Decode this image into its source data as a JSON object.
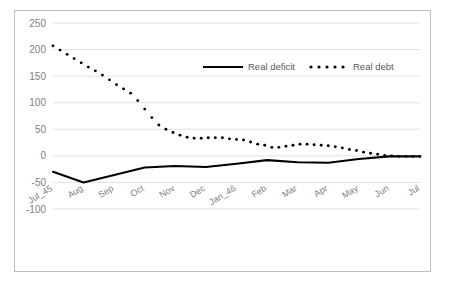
{
  "chart_data": {
    "type": "line",
    "title": "",
    "subtitle": "",
    "xlabel": "",
    "ylabel": "",
    "ylim": [
      -100,
      250
    ],
    "ytick_step": 50,
    "yticks": [
      "250",
      "200",
      "150",
      "100",
      "50",
      "0",
      "-50",
      "-100"
    ],
    "grid": true,
    "legend_position": "top-center",
    "categories": [
      "Jul_45",
      "Aug",
      "Sep",
      "Oct",
      "Nov",
      "Dec",
      "Jan_46",
      "Feb",
      "Mar",
      "Apr",
      "May",
      "Jun",
      "Jul"
    ],
    "x": [
      "Jul_45",
      "Aug",
      "Sep",
      "Oct",
      "Nov",
      "Dec",
      "Jan_46",
      "Feb",
      "Mar",
      "Apr",
      "May",
      "Jun",
      "Jul"
    ],
    "series": [
      {
        "name": "Real deficit",
        "style": "solid",
        "color": "#000000",
        "values": [
          -30,
          -50,
          -36,
          -22,
          -19,
          -21,
          -15,
          -8,
          -12,
          -13,
          -6,
          -1,
          -1
        ]
      },
      {
        "name": "Real debt",
        "style": "dotted",
        "color": "#000000",
        "values": [
          207,
          160,
          118,
          50,
          33,
          34,
          30,
          16,
          22,
          19,
          10,
          1,
          -1
        ]
      }
    ],
    "monthly_points": {
      "note_series": "Real debt",
      "dense_values": [
        207,
        199,
        191,
        183,
        175,
        167,
        160,
        152,
        143,
        134,
        126,
        118,
        104,
        88,
        72,
        58,
        50,
        44,
        39,
        35,
        33,
        33,
        34,
        34,
        34,
        32,
        31,
        30,
        26,
        22,
        20,
        16,
        16,
        18,
        20,
        22,
        22,
        21,
        20,
        19,
        17,
        15,
        12,
        10,
        7,
        5,
        3,
        1,
        0,
        -1,
        -1,
        -1,
        -1
      ]
    }
  },
  "legend": {
    "items": [
      {
        "label": "Real deficit",
        "marker": "solid-line"
      },
      {
        "label": "Real debt",
        "marker": "dotted-line"
      }
    ]
  },
  "colors": {
    "series": "#000000",
    "gridline": "#d9d9d9",
    "tick_text": "#808080",
    "legend_text": "#595959",
    "frame_border": "#bfbfbf",
    "background": "#ffffff"
  }
}
